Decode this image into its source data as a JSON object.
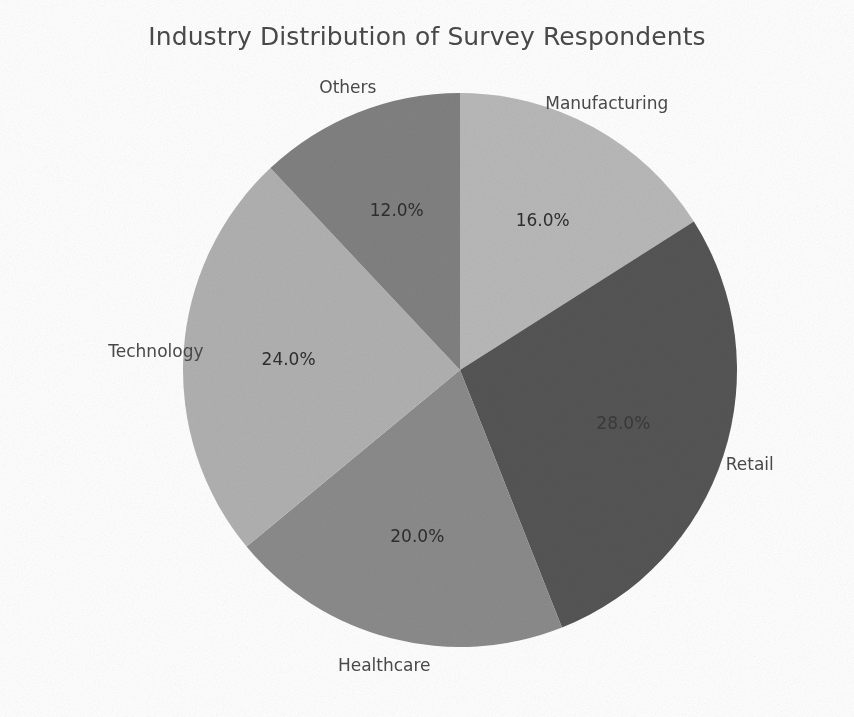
{
  "chart_data": {
    "type": "pie",
    "title": "Industry Distribution of Survey Respondents",
    "categories": [
      "Manufacturing",
      "Retail",
      "Healthcare",
      "Technology",
      "Others"
    ],
    "values": [
      16.0,
      28.0,
      20.0,
      24.0,
      12.0
    ],
    "value_labels": [
      "16.0%",
      "28.0%",
      "20.0%",
      "24.0%",
      "12.0%"
    ],
    "colors": [
      "#b9b9b9",
      "#555555",
      "#8b8b8b",
      "#b1b1b1",
      "#818181"
    ],
    "units": "percent",
    "startangle": 90,
    "direction": "clockwise",
    "legend": "none",
    "labels_position": "outside",
    "pct_position": "inside",
    "xlabel": "",
    "ylabel": "",
    "grid": false,
    "background": "#ffffff",
    "title_color": "#4a4a4a",
    "label_color": "#4a4a4a"
  },
  "figure": {
    "title": "Industry Distribution of Survey Respondents",
    "slices": [
      {
        "name": "Manufacturing",
        "percent_text": "16.0%",
        "value": 16.0,
        "color": "#b9b9b9"
      },
      {
        "name": "Retail",
        "percent_text": "28.0%",
        "value": 28.0,
        "color": "#555555"
      },
      {
        "name": "Healthcare",
        "percent_text": "20.0%",
        "value": 20.0,
        "color": "#8b8b8b"
      },
      {
        "name": "Technology",
        "percent_text": "24.0%",
        "value": 24.0,
        "color": "#b1b1b1"
      },
      {
        "name": "Others",
        "percent_text": "12.0%",
        "value": 12.0,
        "color": "#818181"
      }
    ]
  }
}
